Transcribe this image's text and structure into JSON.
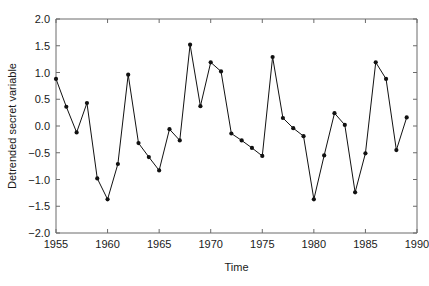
{
  "chart_data": {
    "type": "line",
    "title": "",
    "xlabel": "Time",
    "ylabel": "Detrended secret variable",
    "xlim": [
      1955,
      1990
    ],
    "ylim": [
      -2.0,
      2.0
    ],
    "grid": false,
    "legend": null,
    "marker": "filled-circle",
    "line_color": "#111111",
    "marker_color": "#111111",
    "axis_color": "#6b6b6b",
    "background_color": "#ffffff",
    "xticks": [
      1955,
      1960,
      1965,
      1970,
      1975,
      1980,
      1985,
      1990
    ],
    "xtick_labels": [
      "1955",
      "1960",
      "1965",
      "1970",
      "1975",
      "1980",
      "1985",
      "1990"
    ],
    "yticks": [
      -2.0,
      -1.5,
      -1.0,
      -0.5,
      0.0,
      0.5,
      1.0,
      1.5,
      2.0
    ],
    "ytick_labels": [
      "-2.0",
      "-1.5",
      "-1.0",
      "-0.5",
      "0.0",
      "0.5",
      "1.0",
      "1.5",
      "2.0"
    ],
    "x": [
      1955,
      1956,
      1957,
      1958,
      1959,
      1960,
      1961,
      1962,
      1963,
      1964,
      1965,
      1966,
      1967,
      1968,
      1969,
      1970,
      1971,
      1972,
      1973,
      1974,
      1975,
      1976,
      1977,
      1978,
      1979,
      1980,
      1981,
      1982,
      1983,
      1984,
      1985,
      1986,
      1987,
      1988,
      1989
    ],
    "values": [
      0.88,
      0.36,
      -0.12,
      0.43,
      -0.98,
      -1.37,
      -0.71,
      0.96,
      -0.32,
      -0.58,
      -0.83,
      -0.06,
      -0.27,
      1.52,
      0.37,
      1.19,
      1.02,
      -0.14,
      -0.27,
      -0.41,
      -0.56,
      1.29,
      0.15,
      -0.04,
      -0.19,
      -1.37,
      -0.55,
      0.24,
      0.02,
      -1.24,
      -0.51,
      1.19,
      0.88,
      -0.45,
      0.16
    ],
    "series": [
      {
        "name": "Detrended secret variable",
        "values": [
          0.88,
          0.36,
          -0.12,
          0.43,
          -0.98,
          -1.37,
          -0.71,
          0.96,
          -0.32,
          -0.58,
          -0.83,
          -0.06,
          -0.27,
          1.52,
          0.37,
          1.19,
          1.02,
          -0.14,
          -0.27,
          -0.41,
          -0.56,
          1.29,
          0.15,
          -0.04,
          -0.19,
          -1.37,
          -0.55,
          0.24,
          0.02,
          -1.24,
          -0.51,
          1.19,
          0.88,
          -0.45,
          0.16
        ]
      }
    ]
  }
}
